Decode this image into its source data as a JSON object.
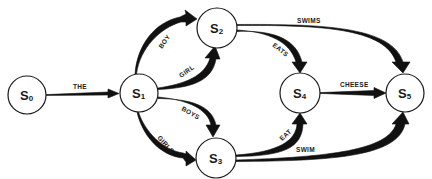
{
  "diagram": {
    "type": "finite-state-automaton",
    "nodes": [
      {
        "id": "s0",
        "letter": "S",
        "sub": "0"
      },
      {
        "id": "s1",
        "letter": "S",
        "sub": "1"
      },
      {
        "id": "s2",
        "letter": "S",
        "sub": "2"
      },
      {
        "id": "s3",
        "letter": "S",
        "sub": "3"
      },
      {
        "id": "s4",
        "letter": "S",
        "sub": "4"
      },
      {
        "id": "s5",
        "letter": "S",
        "sub": "5"
      }
    ],
    "edges": [
      {
        "from": "s0",
        "to": "s1",
        "label": "THE"
      },
      {
        "from": "s1",
        "to": "s2",
        "label": "BOY"
      },
      {
        "from": "s1",
        "to": "s2",
        "label": "GIRL"
      },
      {
        "from": "s1",
        "to": "s3",
        "label": "BOYS"
      },
      {
        "from": "s1",
        "to": "s3",
        "label": "GIRLS"
      },
      {
        "from": "s2",
        "to": "s4",
        "label": "EATS"
      },
      {
        "from": "s2",
        "to": "s5",
        "label": "SWIMS"
      },
      {
        "from": "s3",
        "to": "s4",
        "label": "EAT"
      },
      {
        "from": "s3",
        "to": "s5",
        "label": "SWIM"
      },
      {
        "from": "s4",
        "to": "s5",
        "label": "CHEESE"
      }
    ]
  }
}
